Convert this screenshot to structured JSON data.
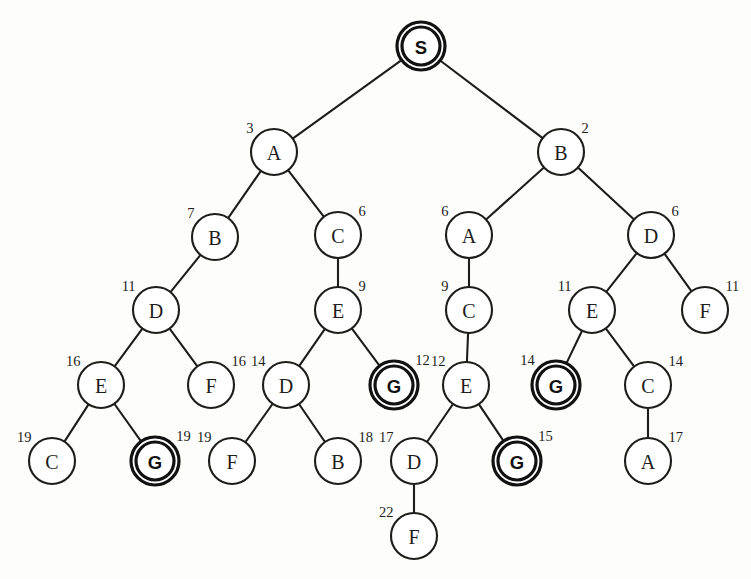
{
  "figure": {
    "node_radius": 23,
    "goal_outer_radius": 24,
    "goal_inner_radius": 19,
    "colors": {
      "stroke": "#1d1d1b",
      "goal_stroke": "#111111",
      "node_fill": "#ffffff",
      "background": "#fdfdfc",
      "text": "#1d1d1b"
    }
  },
  "nodes": [
    {
      "id": "n0",
      "label": "S",
      "cost": "",
      "cost_side": "none",
      "x": 421,
      "y": 46,
      "goal": true,
      "root": true
    },
    {
      "id": "n1",
      "label": "A",
      "cost": "3",
      "cost_side": "left",
      "x": 274,
      "y": 152,
      "goal": false,
      "root": false
    },
    {
      "id": "n2",
      "label": "B",
      "cost": "2",
      "cost_side": "right",
      "x": 561,
      "y": 152,
      "goal": false,
      "root": false
    },
    {
      "id": "n3",
      "label": "B",
      "cost": "7",
      "cost_side": "left",
      "x": 215,
      "y": 237,
      "goal": false,
      "root": false
    },
    {
      "id": "n4",
      "label": "C",
      "cost": "6",
      "cost_side": "right",
      "x": 338,
      "y": 235,
      "goal": false,
      "root": false
    },
    {
      "id": "n5",
      "label": "A",
      "cost": "6",
      "cost_side": "left",
      "x": 469,
      "y": 235,
      "goal": false,
      "root": false
    },
    {
      "id": "n6",
      "label": "D",
      "cost": "6",
      "cost_side": "right",
      "x": 651,
      "y": 235,
      "goal": false,
      "root": false
    },
    {
      "id": "n7",
      "label": "D",
      "cost": "11",
      "cost_side": "left",
      "x": 156,
      "y": 310,
      "goal": false,
      "root": false
    },
    {
      "id": "n8",
      "label": "E",
      "cost": "9",
      "cost_side": "right",
      "x": 338,
      "y": 310,
      "goal": false,
      "root": false
    },
    {
      "id": "n9",
      "label": "C",
      "cost": "9",
      "cost_side": "left",
      "x": 469,
      "y": 310,
      "goal": false,
      "root": false
    },
    {
      "id": "n10",
      "label": "E",
      "cost": "11",
      "cost_side": "left",
      "x": 592,
      "y": 310,
      "goal": false,
      "root": false
    },
    {
      "id": "n11",
      "label": "F",
      "cost": "11",
      "cost_side": "right",
      "x": 705,
      "y": 310,
      "goal": false,
      "root": false
    },
    {
      "id": "n12",
      "label": "E",
      "cost": "16",
      "cost_side": "left",
      "x": 101,
      "y": 385,
      "goal": false,
      "root": false
    },
    {
      "id": "n13",
      "label": "F",
      "cost": "16",
      "cost_side": "right",
      "x": 211,
      "y": 385,
      "goal": false,
      "root": false
    },
    {
      "id": "n14",
      "label": "D",
      "cost": "14",
      "cost_side": "left",
      "x": 286,
      "y": 385,
      "goal": false,
      "root": false
    },
    {
      "id": "n15",
      "label": "G",
      "cost": "12",
      "cost_side": "right",
      "x": 394,
      "y": 385,
      "goal": true,
      "root": false
    },
    {
      "id": "n16",
      "label": "E",
      "cost": "12",
      "cost_side": "left",
      "x": 466,
      "y": 385,
      "goal": false,
      "root": false
    },
    {
      "id": "n17",
      "label": "G",
      "cost": "14",
      "cost_side": "left",
      "x": 556,
      "y": 385,
      "goal": true,
      "root": false
    },
    {
      "id": "n18",
      "label": "C",
      "cost": "14",
      "cost_side": "right",
      "x": 648,
      "y": 385,
      "goal": false,
      "root": false
    },
    {
      "id": "n19",
      "label": "C",
      "cost": "19",
      "cost_side": "left",
      "x": 52,
      "y": 461,
      "goal": false,
      "root": false
    },
    {
      "id": "n20",
      "label": "G",
      "cost": "19",
      "cost_side": "right",
      "x": 155,
      "y": 461,
      "goal": true,
      "root": false
    },
    {
      "id": "n21",
      "label": "F",
      "cost": "19",
      "cost_side": "left",
      "x": 232,
      "y": 461,
      "goal": false,
      "root": false
    },
    {
      "id": "n22",
      "label": "B",
      "cost": "18",
      "cost_side": "right",
      "x": 338,
      "y": 461,
      "goal": false,
      "root": false
    },
    {
      "id": "n23",
      "label": "D",
      "cost": "17",
      "cost_side": "left",
      "x": 414,
      "y": 461,
      "goal": false,
      "root": false
    },
    {
      "id": "n24",
      "label": "G",
      "cost": "15",
      "cost_side": "right",
      "x": 517,
      "y": 461,
      "goal": true,
      "root": false
    },
    {
      "id": "n25",
      "label": "A",
      "cost": "17",
      "cost_side": "right",
      "x": 648,
      "y": 461,
      "goal": false,
      "root": false
    },
    {
      "id": "n26",
      "label": "F",
      "cost": "22",
      "cost_side": "left",
      "x": 414,
      "y": 536,
      "goal": false,
      "root": false
    }
  ],
  "edges": [
    {
      "from": "n0",
      "to": "n1"
    },
    {
      "from": "n0",
      "to": "n2"
    },
    {
      "from": "n1",
      "to": "n3"
    },
    {
      "from": "n1",
      "to": "n4"
    },
    {
      "from": "n2",
      "to": "n5"
    },
    {
      "from": "n2",
      "to": "n6"
    },
    {
      "from": "n3",
      "to": "n7"
    },
    {
      "from": "n4",
      "to": "n8"
    },
    {
      "from": "n5",
      "to": "n9"
    },
    {
      "from": "n6",
      "to": "n10"
    },
    {
      "from": "n6",
      "to": "n11"
    },
    {
      "from": "n7",
      "to": "n12"
    },
    {
      "from": "n7",
      "to": "n13"
    },
    {
      "from": "n8",
      "to": "n14"
    },
    {
      "from": "n8",
      "to": "n15"
    },
    {
      "from": "n9",
      "to": "n16"
    },
    {
      "from": "n10",
      "to": "n17"
    },
    {
      "from": "n10",
      "to": "n18"
    },
    {
      "from": "n12",
      "to": "n19"
    },
    {
      "from": "n12",
      "to": "n20"
    },
    {
      "from": "n14",
      "to": "n21"
    },
    {
      "from": "n14",
      "to": "n22"
    },
    {
      "from": "n16",
      "to": "n23"
    },
    {
      "from": "n16",
      "to": "n24"
    },
    {
      "from": "n18",
      "to": "n25"
    },
    {
      "from": "n23",
      "to": "n26"
    }
  ]
}
